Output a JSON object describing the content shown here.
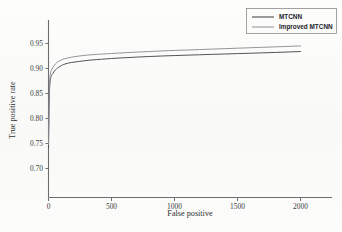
{
  "chart_data": {
    "type": "line",
    "title": "",
    "xlabel": "False positive",
    "ylabel": "True positive rate",
    "xlim": [
      0,
      2250
    ],
    "ylim": [
      0.642,
      0.968
    ],
    "grid": false,
    "legend_position": "top-right",
    "xticks": [
      0,
      500,
      1000,
      1500,
      2000
    ],
    "xtick_labels": [
      "0",
      "500",
      "1000",
      "1500",
      "2000"
    ],
    "yticks": [
      0.7,
      0.75,
      0.8,
      0.85,
      0.9,
      0.95
    ],
    "ytick_labels": [
      "0.70",
      "0.75",
      "0.80",
      "0.85",
      "0.90",
      "0.95"
    ],
    "series": [
      {
        "name": "MTCNN",
        "color": "#4a4a50",
        "x": [
          0,
          3,
          6,
          10,
          16,
          24,
          34,
          48,
          66,
          90,
          120,
          160,
          210,
          270,
          340,
          420,
          500,
          600,
          700,
          800,
          900,
          1000,
          1100,
          1200,
          1300,
          1400,
          1500,
          1600,
          1700,
          1800,
          1900,
          2000
        ],
        "y": [
          0.742,
          0.8,
          0.84,
          0.866,
          0.88,
          0.886,
          0.89,
          0.895,
          0.9,
          0.904,
          0.908,
          0.911,
          0.913,
          0.915,
          0.917,
          0.9185,
          0.92,
          0.9215,
          0.9228,
          0.924,
          0.925,
          0.9259,
          0.9267,
          0.9275,
          0.9283,
          0.929,
          0.9298,
          0.9305,
          0.9313,
          0.9321,
          0.933,
          0.934
        ]
      },
      {
        "name": "Improved MTCNN",
        "color": "#8e8e95",
        "x": [
          0,
          3,
          6,
          10,
          16,
          24,
          34,
          48,
          66,
          90,
          120,
          160,
          210,
          270,
          340,
          420,
          500,
          600,
          700,
          800,
          900,
          1000,
          1100,
          1200,
          1300,
          1400,
          1500,
          1600,
          1700,
          1800,
          1900,
          2000
        ],
        "y": [
          0.748,
          0.812,
          0.852,
          0.878,
          0.891,
          0.897,
          0.902,
          0.907,
          0.912,
          0.9155,
          0.9188,
          0.9215,
          0.9238,
          0.9258,
          0.9275,
          0.9288,
          0.93,
          0.9315,
          0.9328,
          0.934,
          0.9351,
          0.9361,
          0.937,
          0.9379,
          0.9388,
          0.9397,
          0.9406,
          0.9415,
          0.9424,
          0.9433,
          0.9442,
          0.9452
        ]
      }
    ],
    "legend": [
      {
        "label": "MTCNN",
        "color": "#4a4a50"
      },
      {
        "label": "Improved MTCNN",
        "color": "#9a9aa1"
      }
    ]
  }
}
